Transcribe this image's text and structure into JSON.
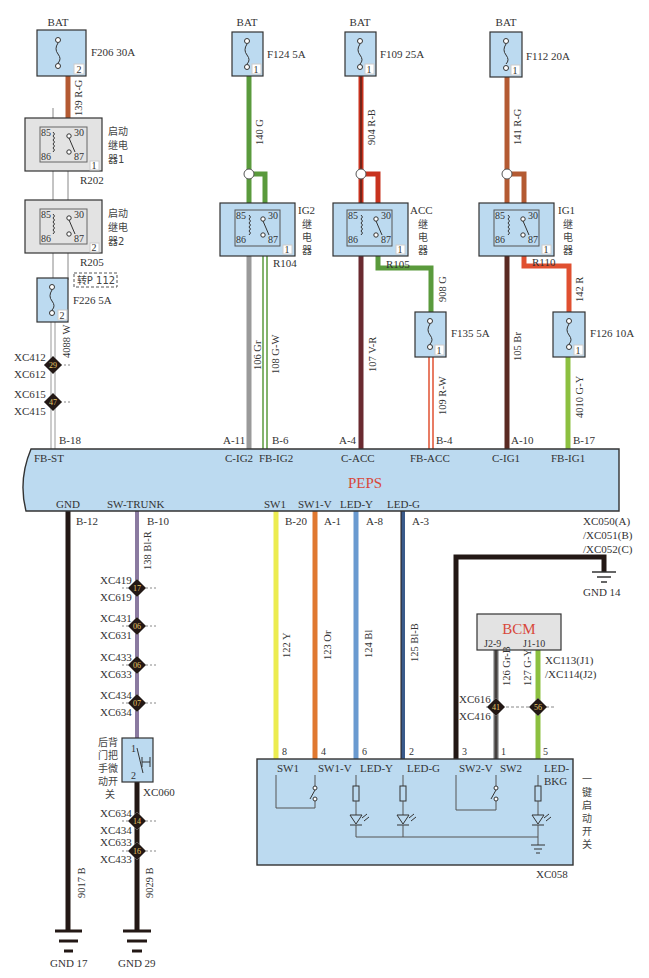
{
  "colors": {
    "module_fill": "#bcdaf0",
    "relay_fill": "#e3e3e3",
    "outline": "#333333",
    "peps_label": "#d8483a",
    "wire_RG": "#b45a32",
    "wire_G": "#5a9a3c",
    "wire_RB": "#c8321e",
    "wire_R": "#e05030",
    "wire_Gr": "#9a9a9a",
    "wire_VR": "#6a2a30",
    "wire_Br": "#5a2a22",
    "wire_Y": "#ecec50",
    "wire_Or": "#e07830",
    "wire_Bl": "#6a9ad0",
    "wire_BlB": "#3a5a8a",
    "wire_B": "#231815",
    "wire_BlR": "#8a7aa0",
    "wire_GY": "#8cc040",
    "wire_GrB": "#6a6a6a"
  },
  "fuses": [
    {
      "id": "F206",
      "rating": "30A",
      "label": "F206 30A",
      "source": "BAT",
      "pin": "2"
    },
    {
      "id": "F124",
      "rating": "5A",
      "label": "F124 5A",
      "source": "BAT",
      "pin": "1"
    },
    {
      "id": "F109",
      "rating": "25A",
      "label": "F109 25A",
      "source": "BAT",
      "pin": "1"
    },
    {
      "id": "F112",
      "rating": "20A",
      "label": "F112 20A",
      "source": "BAT",
      "pin": "1"
    },
    {
      "id": "F226",
      "rating": "5A",
      "label": "F226 5A",
      "pin": "2"
    },
    {
      "id": "F135",
      "rating": "5A",
      "label": "F135 5A",
      "pin": "1"
    },
    {
      "id": "F126",
      "rating": "10A",
      "label": "F126 10A",
      "pin": "1"
    }
  ],
  "relays": [
    {
      "id": "R202",
      "name_lines": [
        "启动",
        "继电",
        "器1"
      ],
      "pins": [
        "85",
        "30",
        "86",
        "87"
      ],
      "tag": "1"
    },
    {
      "id": "R205",
      "name_lines": [
        "启动",
        "继电",
        "器2"
      ],
      "pins": [
        "85",
        "30",
        "86",
        "87"
      ],
      "tag": "2"
    },
    {
      "id": "R104",
      "name_lines": [
        "IG2",
        "继",
        "电",
        "器"
      ],
      "pins": [
        "85",
        "30",
        "86",
        "87"
      ],
      "tag": "1"
    },
    {
      "id": "R105",
      "name_lines": [
        "ACC",
        "继",
        "电",
        "器"
      ],
      "pins": [
        "85",
        "30",
        "86",
        "87"
      ],
      "tag": "1"
    },
    {
      "id": "R110",
      "name_lines": [
        "IG1",
        "继",
        "电",
        "器"
      ],
      "pins": [
        "85",
        "30",
        "86",
        "87"
      ],
      "tag": "1"
    }
  ],
  "page_ref": "转P 112",
  "wires_top": [
    {
      "code": "139 R-G"
    },
    {
      "code": "140 G"
    },
    {
      "code": "904 R-B"
    },
    {
      "code": "141 R-G"
    },
    {
      "code": "4088 W"
    },
    {
      "code": "106 Gr"
    },
    {
      "code": "108 G-W"
    },
    {
      "code": "107 V-R"
    },
    {
      "code": "908 G"
    },
    {
      "code": "109 R-W"
    },
    {
      "code": "105 Br"
    },
    {
      "code": "142 R"
    },
    {
      "code": "4010 G-Y"
    }
  ],
  "splices_top": [
    {
      "upper": "XC412",
      "lower": "XC612",
      "num": "29"
    },
    {
      "upper": "XC615",
      "lower": "XC415",
      "num": "47"
    }
  ],
  "peps": {
    "name": "PEPS",
    "top_pins": [
      {
        "pin": "B-18",
        "signal": "FB-ST"
      },
      {
        "pin": "A-11",
        "signal": "C-IG2"
      },
      {
        "pin": "B-6",
        "signal": "FB-IG2"
      },
      {
        "pin": "A-4",
        "signal": "C-ACC"
      },
      {
        "pin": "B-4",
        "signal": "FB-ACC"
      },
      {
        "pin": "A-10",
        "signal": "C-IG1"
      },
      {
        "pin": "B-17",
        "signal": "FB-IG1"
      }
    ],
    "bottom_pins": [
      {
        "pin": "B-12",
        "signal": "GND"
      },
      {
        "pin": "B-10",
        "signal": "SW-TRUNK"
      },
      {
        "pin": "B-20",
        "signal": "SW1"
      },
      {
        "pin": "A-1",
        "signal": "SW1-V"
      },
      {
        "pin": "A-8",
        "signal": "LED-Y"
      },
      {
        "pin": "A-3",
        "signal": "LED-G"
      }
    ],
    "connectors": [
      "XC050(A)",
      "/XC051(B)",
      "/XC052(C)"
    ]
  },
  "wires_bottom": [
    {
      "code": "138 Bl-R"
    },
    {
      "code": "122 Y"
    },
    {
      "code": "123 Or"
    },
    {
      "code": "124 Bl"
    },
    {
      "code": "125 Bl-B"
    },
    {
      "code": "126 Gr-B"
    },
    {
      "code": "127 G-Y"
    },
    {
      "code": "9017 B"
    },
    {
      "code": "9029 B"
    }
  ],
  "splices_trunk": [
    {
      "upper": "XC419",
      "lower": "XC619",
      "num": "17"
    },
    {
      "upper": "XC431",
      "lower": "XC631",
      "num": "06"
    },
    {
      "upper": "XC433",
      "lower": "XC633",
      "num": "06"
    },
    {
      "upper": "XC434",
      "lower": "XC634",
      "num": "07"
    },
    {
      "upper": "XC634",
      "lower": "XC434",
      "num": "14"
    },
    {
      "upper": "XC633",
      "lower": "XC433",
      "num": "16"
    }
  ],
  "trunk_switch": {
    "name_lines": [
      "后背",
      "门把",
      "手微",
      "动开",
      "关"
    ],
    "connector": "XC060",
    "pin1": "1",
    "pin2": "2"
  },
  "grounds": {
    "gnd14": "GND 14",
    "gnd17": "GND 17",
    "gnd29": "GND 29"
  },
  "bcm": {
    "name": "BCM",
    "pins": [
      "J2-9",
      "J1-10"
    ],
    "connectors": [
      "XC113(J1)",
      "/XC114(J2)"
    ],
    "splices": [
      {
        "upper": "XC616",
        "lower": "XC416",
        "num_a": "41",
        "num_b": "56"
      }
    ]
  },
  "start_switch": {
    "name_vertical": [
      "一",
      "键",
      "启",
      "动",
      "开",
      "关"
    ],
    "connector": "XC058",
    "pins": [
      {
        "num": "8",
        "signal": "SW1"
      },
      {
        "num": "4",
        "signal": "SW1-V"
      },
      {
        "num": "6",
        "signal": "LED-Y"
      },
      {
        "num": "2",
        "signal": "LED-G"
      },
      {
        "num": "3",
        "signal": "SW2-V"
      },
      {
        "num": "1",
        "signal": "SW2"
      },
      {
        "num": "5",
        "signal": "LED-BKG",
        "signal_line1": "LED-",
        "signal_line2": "BKG"
      }
    ]
  },
  "labels": {
    "bat": "BAT"
  }
}
